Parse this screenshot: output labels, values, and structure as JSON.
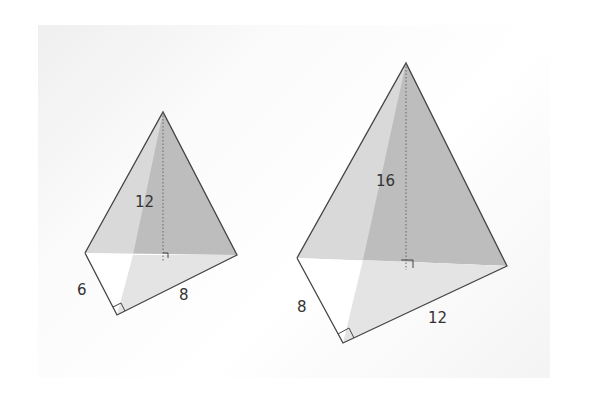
{
  "figure": {
    "pyramids": [
      {
        "name": "small-pyramid",
        "height_label": "12",
        "base_leg_a_label": "6",
        "base_leg_b_label": "8"
      },
      {
        "name": "large-pyramid",
        "height_label": "16",
        "base_leg_a_label": "8",
        "base_leg_b_label": "12"
      }
    ]
  },
  "colors": {
    "face_left": "#d6d6d6",
    "face_right": "#bcbcbc",
    "base_shade": "#e6e6e6",
    "edge": "#444444"
  }
}
